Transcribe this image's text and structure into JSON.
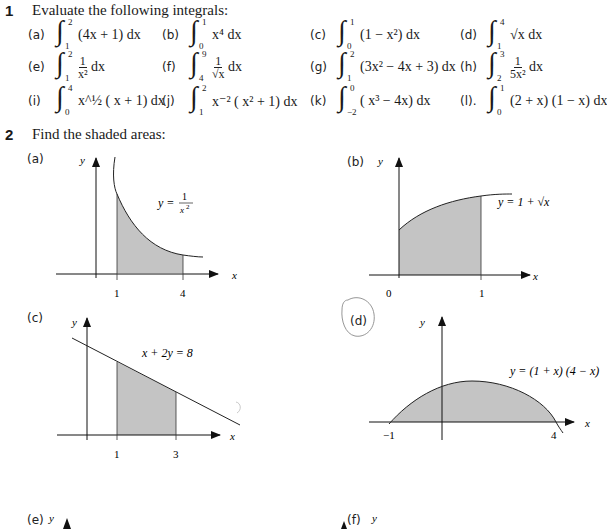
{
  "question1": {
    "number": "1",
    "prompt": "Evaluate the following integrals:",
    "items": [
      {
        "label": "(a)",
        "lower": "1",
        "upper": "2",
        "integrand": "(4x + 1) dx"
      },
      {
        "label": "(b)",
        "lower": "0",
        "upper": "1",
        "integrand": "x⁴ dx"
      },
      {
        "label": "(c)",
        "lower": "0",
        "upper": "1",
        "integrand": "(1 − x²) dx"
      },
      {
        "label": "(d)",
        "lower": "1",
        "upper": "4",
        "integrand": "√x dx"
      },
      {
        "label": "(e)",
        "lower": "1",
        "upper": "2",
        "integrand_num": "1",
        "integrand_den": "x²",
        "integrand_tail": "dx"
      },
      {
        "label": "(f)",
        "lower": "4",
        "upper": "9",
        "integrand_num": "1",
        "integrand_den": "√x",
        "integrand_tail": "dx"
      },
      {
        "label": "(g)",
        "lower": "1",
        "upper": "2",
        "integrand": "(3x² − 4x + 3)  dx"
      },
      {
        "label": "(h)",
        "lower": "2",
        "upper": "3",
        "integrand_num": "1",
        "integrand_den": "5x²",
        "integrand_tail": "dx"
      },
      {
        "label": "(i)",
        "lower": "0",
        "upper": "4",
        "integrand": "x^½ ( x + 1)  dx"
      },
      {
        "label": "(j)",
        "lower": "1",
        "upper": "2",
        "integrand": "x⁻² ( x² + 1)  dx"
      },
      {
        "label": "(k)",
        "lower": "−2",
        "upper": "0",
        "integrand": "( x³ − 4x) dx"
      },
      {
        "label": "(l).",
        "lower": "0",
        "upper": "1",
        "integrand": "(2 + x) (1 − x) dx"
      }
    ]
  },
  "question2": {
    "number": "2",
    "prompt": "Find  the shaded areas:",
    "graphs": [
      {
        "label": "(a)",
        "equation": "y = 1/x²",
        "eq_left": "y =",
        "eq_num": "1",
        "eq_den": "x²",
        "x_ticks": [
          "1",
          "4"
        ],
        "x_axis": "x",
        "y_axis": "y"
      },
      {
        "label": "(b)",
        "equation": "y = 1 + √x",
        "x_ticks": [
          "0",
          "1"
        ],
        "x_axis": "x",
        "y_axis": "y"
      },
      {
        "label": "(c)",
        "equation": "x + 2y = 8",
        "x_ticks": [
          "1",
          "3"
        ],
        "x_axis": "x",
        "y_axis": "y"
      },
      {
        "label": "(d)",
        "equation": "y = (1 + x) (4 − x)",
        "x_ticks": [
          "−1",
          "4"
        ],
        "x_axis": "x",
        "y_axis": "y"
      },
      {
        "label": "(e)",
        "y_axis": "y"
      },
      {
        "label": "(f)",
        "y_axis": "y"
      }
    ]
  },
  "colors": {
    "shade": "#c4c4c4",
    "ink": "#1a1a1a",
    "circle_annotation": "#8a8a8a"
  }
}
